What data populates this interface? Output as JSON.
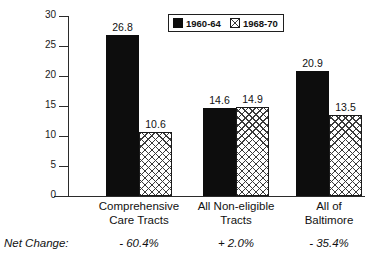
{
  "chart_data": {
    "type": "bar",
    "title": "",
    "subtitle": "",
    "xlabel": "",
    "ylabel": "",
    "ylim": [
      0,
      30
    ],
    "yticks": [
      "0",
      "5",
      "10",
      "15",
      "20",
      "25",
      "30"
    ],
    "grid": false,
    "legend_position": "top-center",
    "categories": [
      [
        "Comprehensive",
        "Care Tracts"
      ],
      [
        "All Non-eligible",
        "Tracts"
      ],
      [
        "All of",
        "Baltimore"
      ]
    ],
    "series": [
      {
        "name": "1960-64",
        "values": [
          26.8,
          14.6,
          20.9
        ],
        "color": "#0d0d0d",
        "fill": "solid"
      },
      {
        "name": "1968-70",
        "values": [
          10.6,
          14.9,
          13.5
        ],
        "color": "#ffffff",
        "fill": "cross-hatch"
      }
    ],
    "annotations": {
      "net_change_caption": "Net Change:",
      "net_change_values": [
        "- 60.4%",
        "+ 2.0%",
        "- 35.4%"
      ]
    }
  }
}
